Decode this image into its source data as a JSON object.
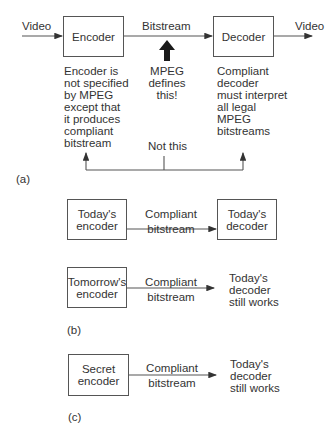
{
  "panel_a": {
    "label": "(a)",
    "input_label": "Video",
    "encoder_box": "Encoder",
    "bitstream_label": "Bitstream",
    "decoder_box": "Decoder",
    "output_label": "Video",
    "encoder_note": [
      "Encoder is",
      "not specified",
      "by MPEG",
      "except that",
      "it produces",
      "compliant",
      "bitstream"
    ],
    "mpeg_note": [
      "MPEG",
      "defines",
      "this!"
    ],
    "decoder_note": [
      "Compliant",
      "decoder",
      "must interpret",
      "all legal",
      "MPEG",
      "bitstreams"
    ],
    "not_this": "Not this"
  },
  "panel_b": {
    "label": "(b)",
    "row1": {
      "encoder": [
        "Today's",
        "encoder"
      ],
      "link": [
        "Compliant",
        "bitstream"
      ],
      "decoder": [
        "Today's",
        "decoder"
      ]
    },
    "row2": {
      "encoder": [
        "Tomorrow's",
        "encoder"
      ],
      "link": [
        "Compliant",
        "bitstream"
      ],
      "result": [
        "Today's",
        "decoder",
        "still works"
      ]
    }
  },
  "panel_c": {
    "label": "(c)",
    "encoder": [
      "Secret",
      "encoder"
    ],
    "link": [
      "Compliant",
      "bitstream"
    ],
    "result": [
      "Today's",
      "decoder",
      "still works"
    ]
  },
  "colors": {
    "line": "#555555",
    "text": "#333333",
    "arrow": "#222222"
  }
}
